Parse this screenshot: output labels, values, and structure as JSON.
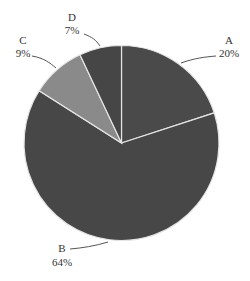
{
  "chart_data": {
    "type": "pie",
    "title": "",
    "categories": [
      "A",
      "B",
      "C",
      "D"
    ],
    "values": [
      20,
      64,
      9,
      7
    ],
    "labels": [
      "20%",
      "64%",
      "9%",
      "7%"
    ],
    "start_angle": "12 o'clock",
    "direction": "clockwise",
    "colors": [
      "#4a4a4a",
      "#474747",
      "#8a8a8a",
      "#464646"
    ],
    "legend": "none"
  },
  "labels": {
    "A": {
      "name": "A",
      "pct": "20%"
    },
    "B": {
      "name": "B",
      "pct": "64%"
    },
    "C": {
      "name": "C",
      "pct": "9%"
    },
    "D": {
      "name": "D",
      "pct": "7%"
    }
  }
}
